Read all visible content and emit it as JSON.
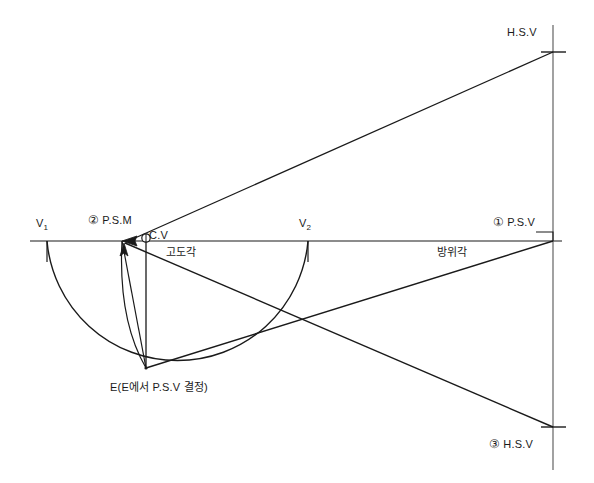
{
  "diagram": {
    "type": "perspective-projection-construction",
    "background_color": "#ffffff",
    "line_color": "#1a1a1a",
    "labels": {
      "hsv_top": "H.S.V",
      "psv_right": "P.S.V",
      "psv_marker": "①",
      "hsv_bottom": "H.S.V",
      "hsv_bottom_marker": "③",
      "v1": "V",
      "v1_sub": "1",
      "v2": "V",
      "v2_sub": "2",
      "psm": "P.S.M",
      "psm_marker": "②",
      "cv": "C.V",
      "elevation_angle": "고도각",
      "azimuth_angle": "방위각",
      "station_point": "E(E에서  P.S.V 결정)"
    },
    "points": {
      "v1": {
        "x": 47,
        "y": 241
      },
      "psm": {
        "x": 122,
        "y": 241
      },
      "cv": {
        "x": 146,
        "y": 241
      },
      "v2": {
        "x": 308,
        "y": 241
      },
      "psv": {
        "x": 553,
        "y": 241
      },
      "hsv_top": {
        "x": 553,
        "y": 52
      },
      "hsv_bottom": {
        "x": 553,
        "y": 427
      },
      "e": {
        "x": 146,
        "y": 368
      },
      "crossing": {
        "x": 305,
        "y": 325
      }
    },
    "geometry": {
      "horizon_line": {
        "x1": 30,
        "y1": 241,
        "x2": 562,
        "y2": 241
      },
      "picture_plane_line": {
        "x1": 553,
        "y1": 25,
        "x2": 553,
        "y2": 470
      },
      "large_arc_from": "v1",
      "large_arc_to": "v2",
      "large_arc_through": "e",
      "small_arc_from": "psm",
      "small_arc_to": "e"
    }
  }
}
